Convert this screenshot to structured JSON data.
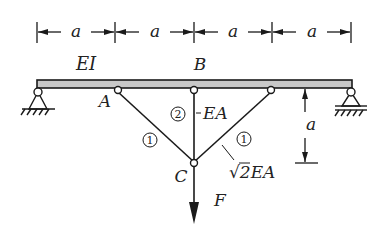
{
  "diagram": {
    "type": "structural-beam-truss",
    "dimensions": {
      "horizontal": [
        "a",
        "a",
        "a",
        "a"
      ],
      "vertical": "a"
    },
    "beam": {
      "label": "EI"
    },
    "nodes": {
      "A": "A",
      "B": "B",
      "C": "C"
    },
    "members": [
      {
        "id": "1",
        "side": "left",
        "label": "1"
      },
      {
        "id": "2",
        "side": "center",
        "label": "2",
        "property": "EA"
      },
      {
        "id": "1",
        "side": "right",
        "label": "1",
        "property_prefix": "√",
        "property_rest": "2EA"
      }
    ],
    "load": {
      "label": "F"
    },
    "colors": {
      "line": "#1a1a1a",
      "beam_fill": "#c8c8c8"
    }
  }
}
